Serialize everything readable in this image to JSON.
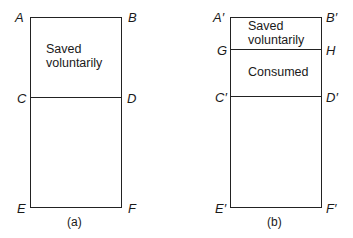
{
  "diagram_a": {
    "labels": {
      "top_left": "A",
      "top_right": "B",
      "mid_left": "C",
      "mid_right": "D",
      "bottom_left": "E",
      "bottom_right": "F"
    },
    "region_text": [
      "Saved",
      "voluntarily"
    ],
    "caption": "(a)"
  },
  "diagram_b": {
    "labels": {
      "top_left": "A′",
      "top_right": "B′",
      "upper_left": "G",
      "upper_right": "H",
      "mid_left": "C′",
      "mid_right": "D′",
      "bottom_left": "E′",
      "bottom_right": "F′"
    },
    "region_top_text": [
      "Saved",
      "voluntarily"
    ],
    "region_mid_text": "Consumed",
    "caption": "(b)"
  }
}
